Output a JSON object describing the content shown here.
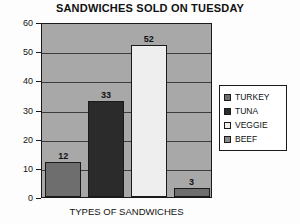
{
  "chart_data": {
    "type": "bar",
    "title": "SANDWICHES SOLD ON TUESDAY",
    "xlabel": "TYPES OF SANDWICHES",
    "ylabel": "",
    "categories": [
      "TURKEY",
      "TUNA",
      "VEGGIE",
      "BEEF"
    ],
    "values": [
      12,
      33,
      52,
      3
    ],
    "data_labels": [
      "12",
      "33",
      "52",
      "3"
    ],
    "ylim": [
      0,
      60
    ],
    "ytick_labels": [
      "0",
      "10",
      "20",
      "30",
      "40",
      "50",
      "60"
    ],
    "ytick_values": [
      0,
      10,
      20,
      30,
      40,
      50,
      60
    ],
    "grid": true,
    "legend_position": "right",
    "legend_entries": [
      {
        "label": "TURKEY",
        "color": "#6e6e6e"
      },
      {
        "label": "TUNA",
        "color": "#2b2b2b"
      },
      {
        "label": "VEGGIE",
        "color": "#eeeeee"
      },
      {
        "label": "BEEF",
        "color": "#8a8a8a"
      }
    ],
    "bar_colors": [
      "#6e6e6e",
      "#2b2b2b",
      "#eeeeee",
      "#6e6e6e"
    ],
    "plot_background": "#a8a8a8",
    "gridline_color": "#3c3c3c",
    "axis_color": "#1a1a1a",
    "page_background": "#fdfdfd"
  }
}
